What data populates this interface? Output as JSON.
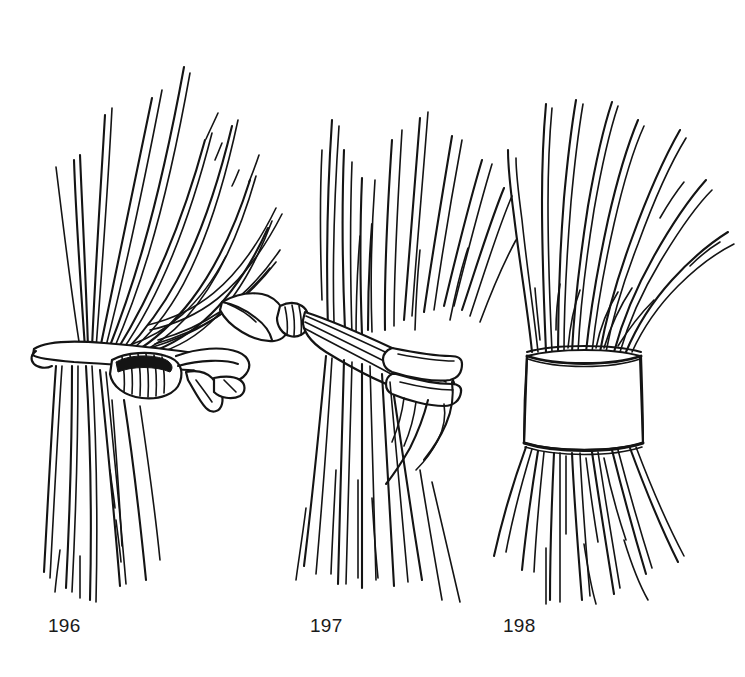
{
  "page": {
    "background_color": "#ffffff",
    "ink_color": "#141414",
    "width": 745,
    "height": 677,
    "style": "black ink line drawing / technical illustration"
  },
  "figures": [
    {
      "number": "196",
      "caption": "196",
      "name": "curtain-with-clip-tieback",
      "description": "Gathered curtain held by a narrow rod-and-clamp clip tieback; folds fan up and to the right",
      "caption_position": {
        "x": 48,
        "y": 616
      }
    },
    {
      "number": "197",
      "caption": "197",
      "name": "curtain-with-fabric-sash-tieback",
      "description": "Curtain drawn back with a wide fabric sash that knots and trails into a pointed tail at the left",
      "caption_position": {
        "x": 310,
        "y": 616
      }
    },
    {
      "number": "198",
      "caption": "198",
      "name": "curtain-with-wide-band-cuff",
      "description": "Curtain gathered inside a broad cylindrical cuff band, folds flaring above and skirt flaring below",
      "caption_position": {
        "x": 503,
        "y": 616
      }
    }
  ]
}
